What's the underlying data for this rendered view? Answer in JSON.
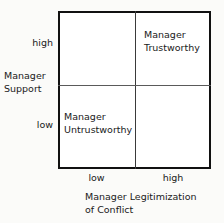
{
  "chart_data": {
    "type": "table",
    "title": "",
    "xlabel": "Manager Legitimization of Conflict",
    "ylabel": "Manager Support",
    "x_categories": [
      "low",
      "high"
    ],
    "y_categories": [
      "low",
      "high"
    ],
    "grid": true,
    "cells": [
      {
        "x": "low",
        "y": "high",
        "label": ""
      },
      {
        "x": "high",
        "y": "high",
        "label": "Manager Trustworthy"
      },
      {
        "x": "low",
        "y": "low",
        "label": "Manager Untrustworthy"
      },
      {
        "x": "high",
        "y": "low",
        "label": ""
      }
    ],
    "colors": {
      "background": "#fbfbf9",
      "plot_background": "#ffffff",
      "border": "#111111",
      "divider": "#3a3a3a",
      "text": "#1a1a1a"
    }
  },
  "y_axis": {
    "title_line1": "Manager",
    "title_line2": "Support",
    "tick_high": "high",
    "tick_low": "low"
  },
  "x_axis": {
    "title_line1": "Manager Legitimization",
    "title_line2": "of Conflict",
    "tick_low": "low",
    "tick_high": "high"
  },
  "quadrants": {
    "top_left": {
      "line1": "",
      "line2": ""
    },
    "top_right": {
      "line1": "Manager",
      "line2": "Trustworthy"
    },
    "bottom_left": {
      "line1": "Manager",
      "line2": "Untrustworthy"
    },
    "bottom_right": {
      "line1": "",
      "line2": ""
    }
  }
}
